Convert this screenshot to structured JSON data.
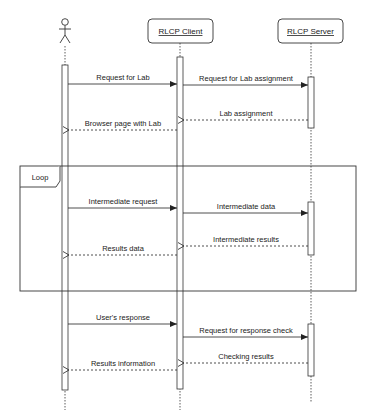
{
  "diagram": {
    "type": "sequence",
    "participants": [
      {
        "id": "user",
        "label": "",
        "kind": "actor"
      },
      {
        "id": "client",
        "label": "RLCP Client",
        "kind": "object"
      },
      {
        "id": "server",
        "label": "RLCP Server",
        "kind": "object"
      }
    ],
    "fragment": {
      "label": "Loop"
    },
    "messages": [
      {
        "label": "Request for Lab",
        "from": "user",
        "to": "client",
        "style": "sync"
      },
      {
        "label": "Request for Lab assignment",
        "from": "client",
        "to": "server",
        "style": "sync"
      },
      {
        "label": "Lab assignment",
        "from": "server",
        "to": "client",
        "style": "return"
      },
      {
        "label": "Browser page with Lab",
        "from": "client",
        "to": "user",
        "style": "return"
      },
      {
        "label": "Intermediate request",
        "from": "user",
        "to": "client",
        "style": "sync"
      },
      {
        "label": "Intermediate data",
        "from": "client",
        "to": "server",
        "style": "sync"
      },
      {
        "label": "Intermediate results",
        "from": "server",
        "to": "client",
        "style": "return"
      },
      {
        "label": "Results data",
        "from": "client",
        "to": "user",
        "style": "return"
      },
      {
        "label": "User's response",
        "from": "user",
        "to": "client",
        "style": "sync"
      },
      {
        "label": "Request for response check",
        "from": "client",
        "to": "server",
        "style": "sync"
      },
      {
        "label": "Checking results",
        "from": "server",
        "to": "client",
        "style": "return"
      },
      {
        "label": "Results information",
        "from": "client",
        "to": "user",
        "style": "return"
      }
    ],
    "colors": {
      "line": "#333333",
      "text": "#222222",
      "background": "#ffffff"
    }
  }
}
